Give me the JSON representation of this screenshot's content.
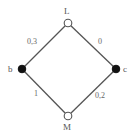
{
  "diagram": {
    "type": "lattice",
    "nodes": {
      "top": {
        "label": "L",
        "style": "open"
      },
      "left": {
        "label": "b",
        "style": "filled"
      },
      "right": {
        "label": "c",
        "style": "filled"
      },
      "bottom": {
        "label": "M",
        "style": "open"
      }
    },
    "edges": {
      "top_left": {
        "from": "L",
        "to": "b",
        "label": "0,3"
      },
      "top_right": {
        "from": "L",
        "to": "c",
        "label": "0"
      },
      "left_bottom": {
        "from": "b",
        "to": "M",
        "label": "1"
      },
      "right_bottom": {
        "from": "c",
        "to": "M",
        "label": "0,2"
      }
    },
    "colors": {
      "edge": "#555555",
      "filled_node": "#111111",
      "open_node_fill": "#ffffff",
      "label": "#666666"
    }
  }
}
